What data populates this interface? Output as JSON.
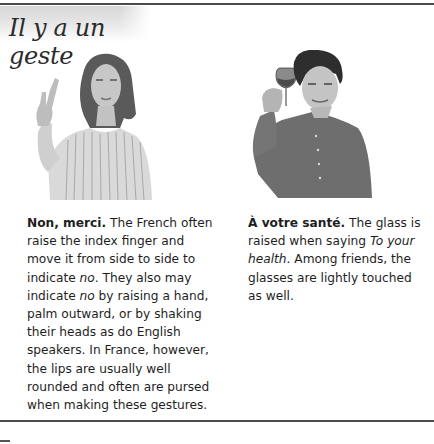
{
  "header": {
    "title": "Il y a un geste"
  },
  "gestures": [
    {
      "image": "woman-raising-index-finger-photo",
      "heading": "Non, merci.",
      "body_parts": [
        " The French often raise the index finger and move it from side to side to indicate ",
        "no",
        ". They also may indicate ",
        "no",
        " by raising a hand, palm outward, or by shaking their heads as do English speakers. In France, however, the lips are usually well rounded and often are pursed when making these gestures."
      ]
    },
    {
      "image": "man-raising-wine-glass-photo",
      "heading": "À votre santé.",
      "body_parts": [
        " The glass is raised when saying ",
        "To your health",
        ". Among friends, the glasses are lightly touched as well."
      ]
    }
  ]
}
